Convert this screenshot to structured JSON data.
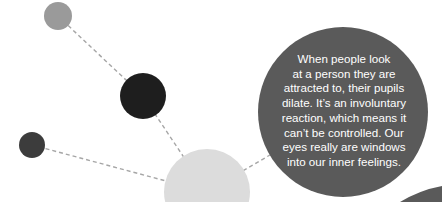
{
  "infographic": {
    "text_lines": [
      "When people look",
      "at a person they are",
      "attracted to, their pupils",
      "dilate. It’s an involuntary",
      "reaction, which means it",
      "can’t be controlled. Our",
      "eyes really are windows",
      "into our inner feelings."
    ],
    "colors": {
      "main_bubble": "#5a5a5a",
      "gray_dot": "#9a9a9a",
      "black_dot": "#1e1e1e",
      "dark_dot": "#3c3c3c",
      "light_bubble": "#dcdcdc",
      "connector": "#a6a6a6"
    }
  }
}
